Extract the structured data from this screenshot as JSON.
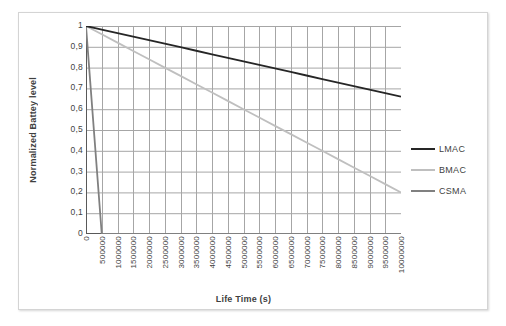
{
  "chart_data": {
    "type": "line",
    "title": "",
    "xlabel": "Life Time (s)",
    "ylabel": "Normalized Battey level",
    "xlim": [
      0,
      10000000
    ],
    "ylim": [
      0,
      1
    ],
    "grid": true,
    "legend_position": "right",
    "x_tick_labels": [
      "0",
      "500000",
      "1000000",
      "1500000",
      "2000000",
      "2500000",
      "3000000",
      "3500000",
      "4000000",
      "4500000",
      "5000000",
      "5500000",
      "6000000",
      "6500000",
      "7000000",
      "7500000",
      "8000000",
      "8500000",
      "9000000",
      "9500000",
      "10000000"
    ],
    "x_tick_values": [
      0,
      500000,
      1000000,
      1500000,
      2000000,
      2500000,
      3000000,
      3500000,
      4000000,
      4500000,
      5000000,
      5500000,
      6000000,
      6500000,
      7000000,
      7500000,
      8000000,
      8500000,
      9000000,
      9500000,
      10000000
    ],
    "y_tick_labels": [
      "1",
      "0,9",
      "0,8",
      "0,7",
      "0,6",
      "0,5",
      "0,4",
      "0,3",
      "0,2",
      "0,1",
      "0"
    ],
    "y_tick_values": [
      1,
      0.9,
      0.8,
      0.7,
      0.6,
      0.5,
      0.4,
      0.3,
      0.2,
      0.1,
      0
    ],
    "x": [
      0,
      500000,
      1000000,
      1500000,
      2000000,
      2500000,
      3000000,
      3500000,
      4000000,
      4500000,
      5000000,
      5500000,
      6000000,
      6500000,
      7000000,
      7500000,
      8000000,
      8500000,
      9000000,
      9500000,
      10000000
    ],
    "series": [
      {
        "name": "LMAC",
        "color": "#262626",
        "width": 1.8,
        "values": [
          1,
          0.983,
          0.966,
          0.949,
          0.932,
          0.915,
          0.898,
          0.881,
          0.864,
          0.847,
          0.83,
          0.813,
          0.796,
          0.779,
          0.762,
          0.745,
          0.728,
          0.711,
          0.694,
          0.677,
          0.66
        ]
      },
      {
        "name": "BMAC",
        "color": "#bfbfbf",
        "width": 1.8,
        "values": [
          1,
          0.96,
          0.92,
          0.88,
          0.84,
          0.8,
          0.76,
          0.72,
          0.68,
          0.64,
          0.6,
          0.56,
          0.52,
          0.48,
          0.44,
          0.4,
          0.36,
          0.32,
          0.28,
          0.24,
          0.2
        ]
      },
      {
        "name": "CSMA",
        "color": "#808080",
        "width": 1.8,
        "values": [
          1,
          0,
          0,
          0,
          0,
          0,
          0,
          0,
          0,
          0,
          0,
          0,
          0,
          0,
          0,
          0,
          0,
          0,
          0,
          0,
          0
        ]
      }
    ]
  },
  "legend": {
    "items": [
      {
        "label": "LMAC",
        "color": "#262626"
      },
      {
        "label": "BMAC",
        "color": "#bfbfbf"
      },
      {
        "label": "CSMA",
        "color": "#808080"
      }
    ]
  },
  "axes": {
    "x_title": "Life Time (s)",
    "y_title": "Normalized Battey level"
  },
  "colors": {
    "grid": "#a6a6a6",
    "axis": "#808080",
    "text": "#3f3f3f",
    "frame": "#d4d4d4",
    "background": "#ffffff"
  }
}
